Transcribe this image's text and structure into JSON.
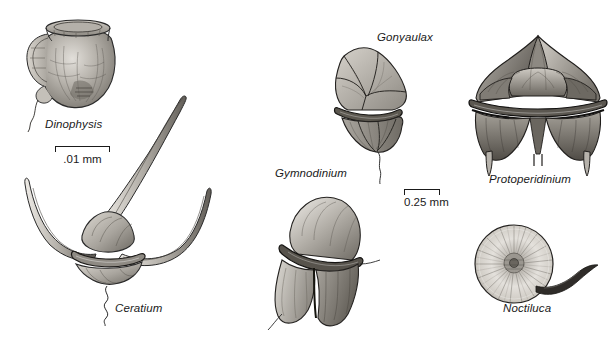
{
  "figure": {
    "background_color": "#ffffff",
    "ink_color": "#1a1a1a",
    "style": "grayscale scientific pen-and-ink illustration"
  },
  "specimens": [
    {
      "id": "dinophysis",
      "label": "Dinophysis",
      "label_x": 45,
      "label_y": 118,
      "description": "urn-shaped theca with flared apical collar and lateral sail-like list, trailing flagellum"
    },
    {
      "id": "ceratium",
      "label": "Ceratium",
      "label_x": 115,
      "label_y": 302,
      "description": "central body with one long apical horn and two curved antapical horns, wavy flagellum"
    },
    {
      "id": "gonyaulax",
      "label": "Gonyaulax",
      "label_x": 377,
      "label_y": 31,
      "description": "angular armored theca with polygonal plates and cingulum, trailing flagellum"
    },
    {
      "id": "gymnodinium",
      "label": "Gymnodinium",
      "label_x": 275,
      "label_y": 167,
      "description": "unarmored cell with rounded epicone, deep cingulum and lobed hypocone"
    },
    {
      "id": "protoperidinium",
      "label": "Protoperidinium",
      "label_x": 489,
      "label_y": 173,
      "description": "armored theca with apical horn, prominent cingulum and two antapical spines"
    },
    {
      "id": "noctiluca",
      "label": "Noctiluca",
      "label_x": 503,
      "label_y": 302,
      "description": "large spherical cell with radial striations and single curved tentacle"
    }
  ],
  "scale_bars": [
    {
      "id": "scale-dinophysis",
      "caption": ".01 mm",
      "x": 55,
      "y": 146,
      "width": 55,
      "applies_to": "Dinophysis and Ceratium"
    },
    {
      "id": "scale-center",
      "caption": "0.25 mm",
      "x": 404,
      "y": 189,
      "width": 36,
      "applies_to": "Gonyaulax, Gymnodinium, Protoperidinium and Noctiluca"
    }
  ]
}
